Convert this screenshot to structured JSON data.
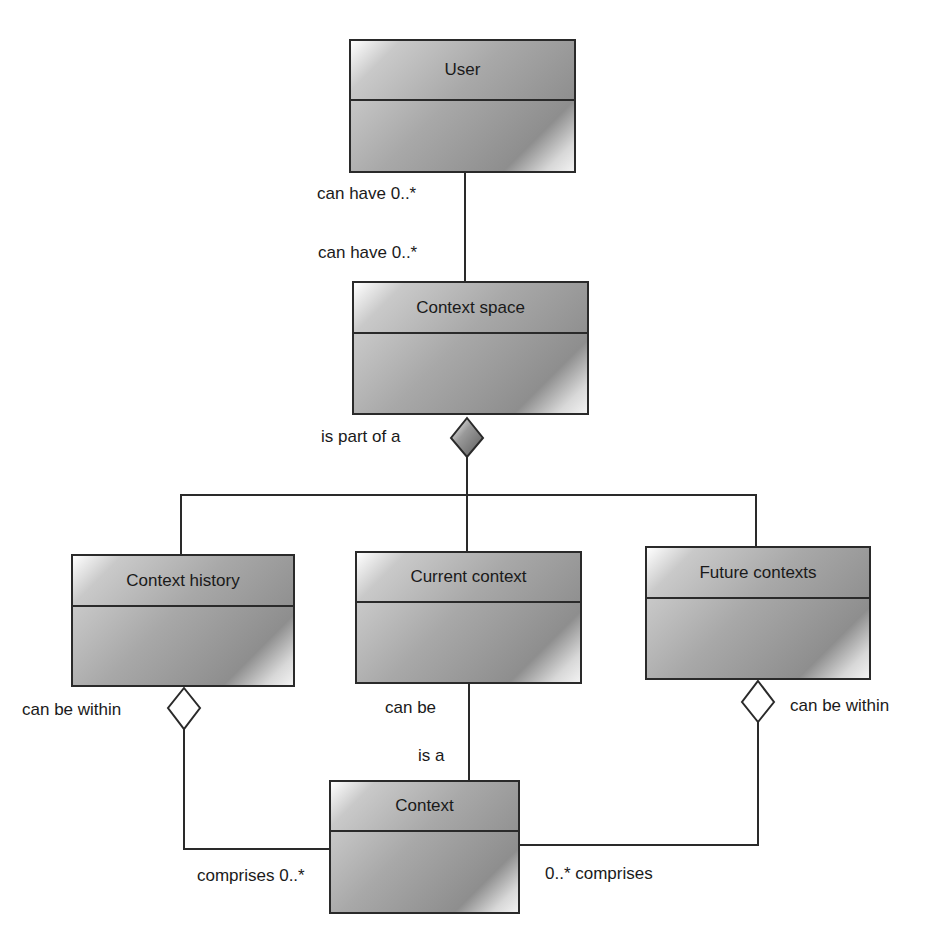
{
  "diagram": {
    "type": "UML class diagram",
    "classes": {
      "user": "User",
      "context_space": "Context space",
      "context_history": "Context history",
      "current_context": "Current context",
      "future_contexts": "Future contexts",
      "context": "Context"
    },
    "labels": {
      "user_multiplicity": "can have 0..*",
      "space_multiplicity": "can have 0..*",
      "is_part_of": "is part of a",
      "history_within": "can be within",
      "future_within": "can be within",
      "current_can_be": "can be",
      "context_is_a": "is a",
      "comprises_left": "comprises 0..*",
      "comprises_right": "0..* comprises"
    },
    "relationships": [
      {
        "from": "User",
        "to": "Context space",
        "kind": "association",
        "label_from": "can have 0..*",
        "label_to": "can have 0..*"
      },
      {
        "from": "Context space",
        "to": [
          "Context history",
          "Current context",
          "Future contexts"
        ],
        "kind": "composition",
        "label": "is part of a"
      },
      {
        "from": "Context history",
        "to": "Context",
        "kind": "aggregation",
        "labels": [
          "can be within",
          "comprises 0..*"
        ]
      },
      {
        "from": "Current context",
        "to": "Context",
        "kind": "association",
        "labels": [
          "can be",
          "is a"
        ]
      },
      {
        "from": "Future contexts",
        "to": "Context",
        "kind": "aggregation",
        "labels": [
          "can be within",
          "0..* comprises"
        ]
      }
    ]
  }
}
